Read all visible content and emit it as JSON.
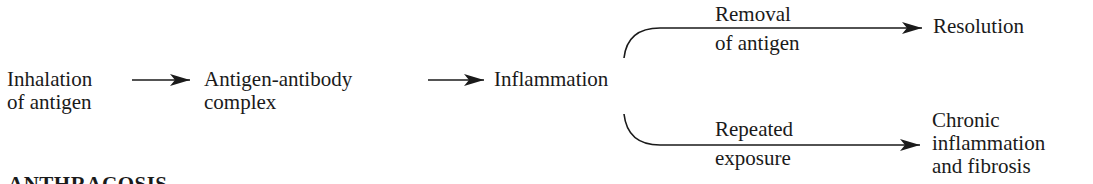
{
  "diagram": {
    "nodes": {
      "inhalation": [
        "Inhalation",
        "of antigen"
      ],
      "complex": [
        "Antigen-antibody",
        "complex"
      ],
      "inflammation": "Inflammation",
      "resolution": "Resolution",
      "chronic": [
        "Chronic",
        "inflammation",
        "and fibrosis"
      ]
    },
    "edge_labels": {
      "removal": [
        "Removal",
        "of antigen"
      ],
      "repeated": [
        "Repeated",
        "exposure"
      ]
    },
    "edges": [
      {
        "from": "Inhalation of antigen",
        "to": "Antigen-antibody complex"
      },
      {
        "from": "Antigen-antibody complex",
        "to": "Inflammation"
      },
      {
        "from": "Inflammation",
        "to": "Resolution",
        "label": "Removal of antigen"
      },
      {
        "from": "Inflammation",
        "to": "Chronic inflammation and fibrosis",
        "label": "Repeated exposure"
      }
    ]
  },
  "section_heading": "ANTHRACOSIS"
}
